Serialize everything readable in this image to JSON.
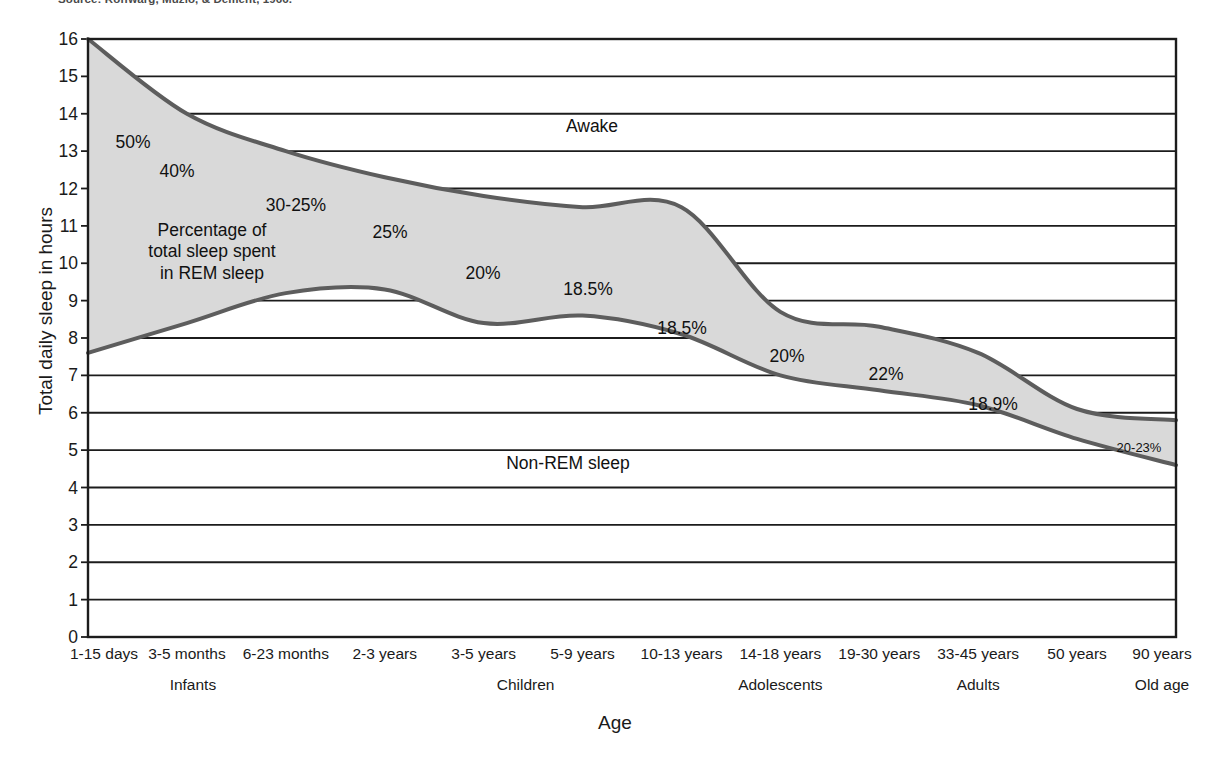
{
  "source_note": "Source: Roffwarg, Muzio, & Dement, 1966.",
  "axes": {
    "y_title": "Total daily sleep in hours",
    "x_title": "Age",
    "y_ticks": [
      0,
      1,
      2,
      3,
      4,
      5,
      6,
      7,
      8,
      9,
      10,
      11,
      12,
      13,
      14,
      15,
      16
    ],
    "y_min": 0,
    "y_max": 16
  },
  "chart_data": {
    "type": "area",
    "xlabel": "Age",
    "ylabel": "Total daily sleep in hours",
    "ylim": [
      0,
      16
    ],
    "grid": true,
    "legend": "none",
    "categories": [
      "1-15 days",
      "3-5 months",
      "6-23 months",
      "2-3 years",
      "3-5 years",
      "5-9 years",
      "10-13 years",
      "14-18 years",
      "19-30 years",
      "33-45 years",
      "50 years",
      "90 years"
    ],
    "age_groups": [
      {
        "label": "Infants",
        "categories": [
          "1-15 days",
          "3-5 months",
          "6-23 months"
        ]
      },
      {
        "label": "Children",
        "categories": [
          "2-3 years",
          "3-5 years",
          "5-9 years",
          "10-13 years"
        ]
      },
      {
        "label": "Adolescents",
        "categories": [
          "14-18 years"
        ]
      },
      {
        "label": "Adults",
        "categories": [
          "19-30 years",
          "33-45 years",
          "50 years"
        ]
      },
      {
        "label": "Old age",
        "categories": [
          "90 years"
        ]
      }
    ],
    "series": [
      {
        "name": "Total daily sleep (upper boundary of shaded REM band)",
        "values": [
          16.0,
          14.0,
          13.0,
          12.3,
          11.8,
          11.5,
          11.5,
          8.7,
          8.3,
          7.6,
          6.1,
          5.8
        ]
      },
      {
        "name": "Non-REM sleep (lower boundary of shaded REM band)",
        "values": [
          7.6,
          8.4,
          9.2,
          9.3,
          8.4,
          8.6,
          8.1,
          7.0,
          6.6,
          6.2,
          5.3,
          4.6
        ]
      }
    ],
    "rem_percentages": [
      {
        "label": "50%",
        "category": "1-15 days"
      },
      {
        "label": "40%",
        "category": "3-5 months"
      },
      {
        "label": "30-25%",
        "category": "6-23 months"
      },
      {
        "label": "25%",
        "category": "2-3 years"
      },
      {
        "label": "20%",
        "category": "3-5 years"
      },
      {
        "label": "18.5%",
        "category": "5-9 years"
      },
      {
        "label": "18.5%",
        "category": "10-13 years"
      },
      {
        "label": "20%",
        "category": "14-18 years"
      },
      {
        "label": "22%",
        "category": "19-30 years"
      },
      {
        "label": "18.9%",
        "category": "33-45 years"
      },
      {
        "label": "20-23%",
        "category": "90 years"
      }
    ],
    "region_labels": {
      "awake": "Awake",
      "rem_band": "Percentage of\ntotal sleep spent\nin REM sleep",
      "non_rem": "Non-REM sleep"
    }
  },
  "annotations": {
    "awake": "Awake",
    "non_rem": "Non-REM sleep",
    "rem_band_line1": "Percentage of",
    "rem_band_line2": "total sleep spent",
    "rem_band_line3": "in REM sleep",
    "p_50": "50%",
    "p_40": "40%",
    "p_30_25": "30-25%",
    "p_25": "25%",
    "p_20a": "20%",
    "p_185a": "18.5%",
    "p_185b": "18.5%",
    "p_20b": "20%",
    "p_22": "22%",
    "p_189": "18.9%",
    "p_20_23": "20-23%"
  },
  "x_axis_labels": [
    "1-15 days",
    "3-5 months",
    "6-23 months",
    "2-3 years",
    "3-5 years",
    "5-9 years",
    "10-13 years",
    "14-18 years",
    "19-30 years",
    "33-45 years",
    "50 years",
    "90 years"
  ],
  "x_group_labels": [
    "Infants",
    "Children",
    "Adolescents",
    "Adults",
    "Old age"
  ],
  "colors": {
    "band_fill": "#d9d9d9",
    "band_stroke": "#5d5d5d",
    "gridline": "#1c1c1c",
    "axis": "#1c1c1c",
    "text": "#111111"
  }
}
